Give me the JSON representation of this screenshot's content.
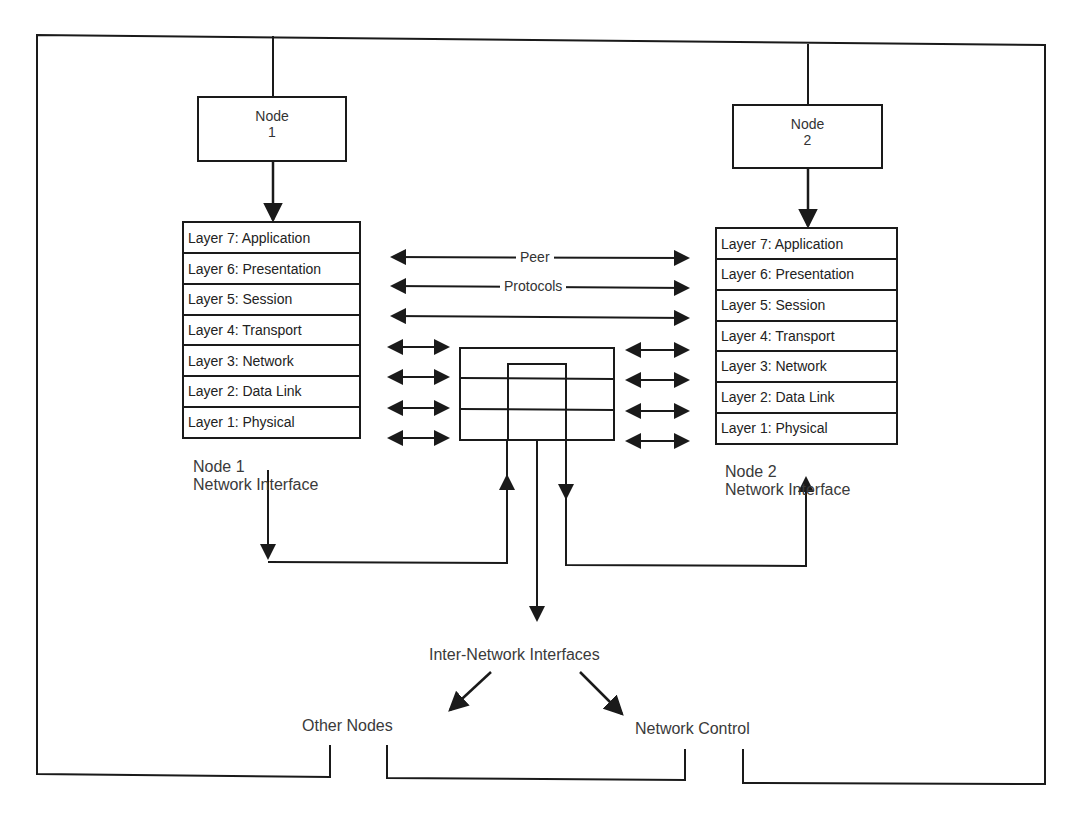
{
  "nodes": {
    "node1": {
      "title": "Node",
      "number": "1"
    },
    "node2": {
      "title": "Node",
      "number": "2"
    }
  },
  "stack_left": {
    "layers": [
      "Layer 7: Application",
      "Layer 6: Presentation",
      "Layer 5: Session",
      "Layer 4: Transport",
      "Layer 3: Network",
      "Layer 2: Data Link",
      "Layer 1: Physical"
    ],
    "caption_line1": "Node 1",
    "caption_line2": "Network Interface"
  },
  "stack_right": {
    "layers": [
      "Layer 7: Application",
      "Layer 6: Presentation",
      "Layer 5: Session",
      "Layer 4: Transport",
      "Layer 3: Network",
      "Layer 2: Data Link",
      "Layer 1: Physical"
    ],
    "caption_line1": "Node 2",
    "caption_line2": "Network Interface"
  },
  "peer_protocols": {
    "line1": "Peer",
    "line2": "Protocols"
  },
  "inter_network": {
    "label": "Inter-Network Interfaces",
    "left_target": "Other Nodes",
    "right_target": "Network Control"
  },
  "colors": {
    "line": "#1a1a1a",
    "text": "#333333",
    "background": "#ffffff"
  }
}
